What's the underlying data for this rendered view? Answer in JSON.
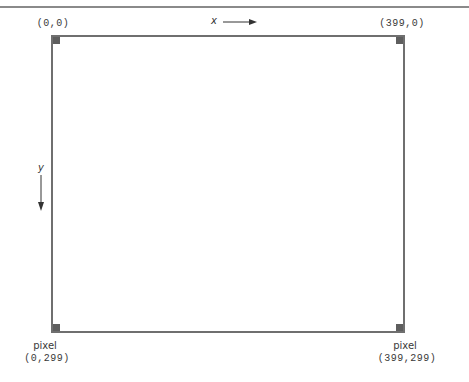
{
  "diagram": {
    "x_axis": {
      "label": "x",
      "direction": "right"
    },
    "y_axis": {
      "label": "y",
      "direction": "down"
    },
    "corners": {
      "top_left": {
        "prefix": "",
        "coords": "(0,0)"
      },
      "top_right": {
        "prefix": "",
        "coords": "(399,0)"
      },
      "bottom_left": {
        "prefix": "pixel",
        "coords": "(0,299)"
      },
      "bottom_right": {
        "prefix": "pixel",
        "coords": "(399,299)"
      }
    },
    "colors": {
      "frame": "#6f6f6f",
      "corner_marker": "#5e5e5e",
      "text": "#3a3a3a"
    }
  }
}
